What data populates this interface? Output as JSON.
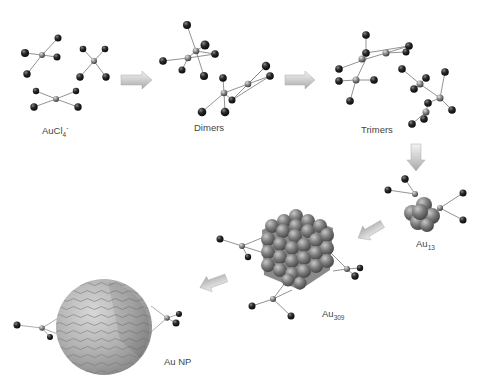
{
  "diagram": {
    "stages": [
      {
        "id": "aucl4",
        "label": "AuCl",
        "subscript": "4",
        "superscript": "-"
      },
      {
        "id": "dimers",
        "label": "Dimers"
      },
      {
        "id": "trimers",
        "label": "Trimers"
      },
      {
        "id": "au13",
        "label": "Au",
        "subscript": "13"
      },
      {
        "id": "au309",
        "label": "Au",
        "subscript": "309"
      },
      {
        "id": "aunp",
        "label": "Au NP"
      }
    ],
    "arrows": [
      {
        "from": "aucl4",
        "to": "dimers",
        "direction": "right"
      },
      {
        "from": "dimers",
        "to": "trimers",
        "direction": "right"
      },
      {
        "from": "trimers",
        "to": "au13",
        "direction": "down"
      },
      {
        "from": "au13",
        "to": "au309",
        "direction": "down-left"
      },
      {
        "from": "au309",
        "to": "aunp",
        "direction": "down-left"
      }
    ],
    "colors": {
      "atom_dark": "#1e1e1e",
      "atom_gold": "#8a8a8a",
      "bond": "#777777",
      "arrow_fill": "#d4d4d4",
      "cluster": "#7a7a7a",
      "sphere": "#b8b8b8",
      "text": "#444444"
    }
  }
}
